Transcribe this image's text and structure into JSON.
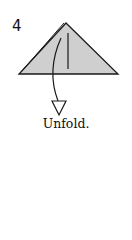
{
  "step": {
    "number": "4"
  },
  "caption": "Unfold.",
  "colors": {
    "paper_fill": "#cfcfcf",
    "line": "#1a1a1a",
    "background": "#ffffff"
  },
  "diagram": {
    "shape": "triangle",
    "apex": [
      66,
      23
    ],
    "base_left": [
      19,
      74
    ],
    "base_right": [
      118,
      74
    ],
    "crease": {
      "x": 68,
      "y1": 33,
      "y2": 69
    },
    "arrow": {
      "type": "unfold-arrow",
      "direction": "down"
    }
  }
}
